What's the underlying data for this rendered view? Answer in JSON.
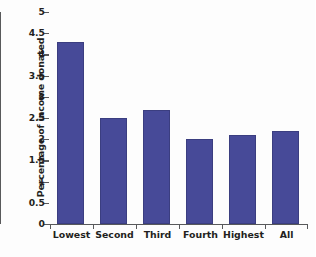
{
  "chart_data": {
    "type": "bar",
    "title": "",
    "xlabel": "",
    "ylabel": "Percentage of income donated",
    "categories": [
      "Lowest",
      "Second",
      "Third",
      "Fourth",
      "Highest",
      "All"
    ],
    "values": [
      4.3,
      2.5,
      2.7,
      2.0,
      2.1,
      2.2
    ],
    "ylim": [
      0,
      5
    ],
    "ytick_labels": [
      "0",
      "0.5",
      "1",
      "1.5",
      "2",
      "2.5",
      "3",
      "3.5",
      "4",
      "4.5",
      "5"
    ],
    "ytick_values": [
      0,
      0.5,
      1,
      1.5,
      2,
      2.5,
      3,
      3.5,
      4,
      4.5,
      5
    ],
    "grid": false,
    "legend": false,
    "bar_color": "#474a98",
    "bar_edge_color": "#3b3e80",
    "axis_color": "#58595b",
    "text_color": "#231f20",
    "background": "#ffffff"
  }
}
